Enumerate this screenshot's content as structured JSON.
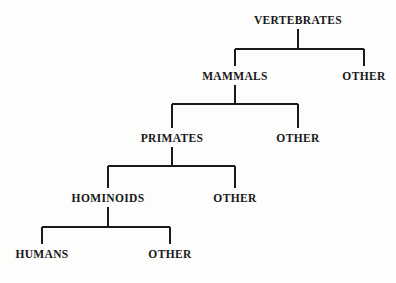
{
  "diagram": {
    "type": "taxonomy-tree",
    "background_color": "#fdfdfb",
    "line_color": "#1a191c",
    "text_color": "#18171a",
    "line_width": 2,
    "levels": 5,
    "nodes": [
      {
        "id": "vertebrates",
        "label": "VERTEBRATES",
        "level": 0,
        "x": 298,
        "y": 14
      },
      {
        "id": "mammals",
        "label": "MAMMALS",
        "level": 1,
        "x": 235,
        "y": 70
      },
      {
        "id": "other1",
        "label": "OTHER",
        "level": 1,
        "x": 364,
        "y": 70
      },
      {
        "id": "primates",
        "label": "PRIMATES",
        "level": 2,
        "x": 172,
        "y": 132
      },
      {
        "id": "other2",
        "label": "OTHER",
        "level": 2,
        "x": 298,
        "y": 132
      },
      {
        "id": "hominoids",
        "label": "HOMINOIDS",
        "level": 3,
        "x": 108,
        "y": 192
      },
      {
        "id": "other3",
        "label": "OTHER",
        "level": 3,
        "x": 235,
        "y": 192
      },
      {
        "id": "humans",
        "label": "HUMANS",
        "level": 4,
        "x": 42,
        "y": 248
      },
      {
        "id": "other4",
        "label": "OTHER",
        "level": 4,
        "x": 170,
        "y": 248
      }
    ],
    "edges": [
      {
        "id": "edge-vertebrates",
        "parent": "vertebrates",
        "children": [
          "mammals",
          "other1"
        ]
      },
      {
        "id": "edge-mammals",
        "parent": "mammals",
        "children": [
          "primates",
          "other2"
        ]
      },
      {
        "id": "edge-primates",
        "parent": "primates",
        "children": [
          "hominoids",
          "other3"
        ]
      },
      {
        "id": "edge-hominoids",
        "parent": "hominoids",
        "children": [
          "humans",
          "other4"
        ]
      }
    ],
    "connectors": [
      {
        "id": "connector-1",
        "stem_x": 298,
        "stem_top": 29,
        "bar_y": 49,
        "bar_left": 235,
        "bar_right": 364,
        "leg_bottom": 66
      },
      {
        "id": "connector-2",
        "stem_x": 235,
        "stem_top": 85,
        "bar_y": 104,
        "bar_left": 172,
        "bar_right": 298,
        "leg_bottom": 128
      },
      {
        "id": "connector-3",
        "stem_x": 172,
        "stem_top": 147,
        "bar_y": 166,
        "bar_left": 108,
        "bar_right": 235,
        "leg_bottom": 188
      },
      {
        "id": "connector-4",
        "stem_x": 108,
        "stem_top": 207,
        "bar_y": 227,
        "bar_left": 42,
        "bar_right": 170,
        "leg_bottom": 244
      }
    ]
  }
}
